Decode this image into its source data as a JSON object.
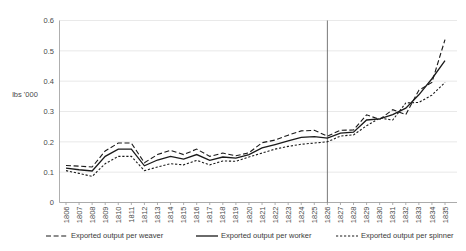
{
  "chart_data": {
    "type": "line",
    "title": "",
    "xlabel": "",
    "ylabel": "lbs '000",
    "ylim": [
      0,
      0.6
    ],
    "ytick_step": 0.1,
    "yticks": [
      "0",
      "0.1",
      "0.2",
      "0.3",
      "0.4",
      "0.5",
      "0.6"
    ],
    "grid": true,
    "legend_position": "bottom",
    "categories": [
      "1806",
      "1807",
      "1808",
      "1809",
      "1810",
      "1811",
      "1812",
      "1813",
      "1814",
      "1815",
      "1816",
      "1817",
      "1818",
      "1819",
      "1820",
      "1821",
      "1822",
      "1823",
      "1824",
      "1825",
      "1826",
      "1827",
      "1828",
      "1829",
      "1830",
      "1831",
      "1832",
      "1833",
      "1834",
      "1835"
    ],
    "annotations": [
      {
        "type": "vertical-line",
        "x": "1826",
        "label": ""
      }
    ],
    "series": [
      {
        "name": "Exported output per weaver",
        "style": "dashed",
        "values": [
          0.122,
          0.12,
          0.117,
          0.17,
          0.196,
          0.196,
          0.131,
          0.158,
          0.172,
          0.158,
          0.176,
          0.152,
          0.163,
          0.154,
          0.164,
          0.197,
          0.206,
          0.222,
          0.236,
          0.238,
          0.219,
          0.238,
          0.239,
          0.289,
          0.274,
          0.306,
          0.29,
          0.37,
          0.396,
          0.537
        ]
      },
      {
        "name": "Exported output per worker",
        "style": "solid",
        "values": [
          0.113,
          0.108,
          0.104,
          0.152,
          0.176,
          0.176,
          0.121,
          0.14,
          0.152,
          0.143,
          0.158,
          0.139,
          0.15,
          0.146,
          0.158,
          0.18,
          0.191,
          0.203,
          0.215,
          0.217,
          0.212,
          0.229,
          0.232,
          0.272,
          0.276,
          0.29,
          0.311,
          0.355,
          0.408,
          0.468
        ]
      },
      {
        "name": "Exported output per spinner",
        "style": "dotted",
        "values": [
          0.105,
          0.096,
          0.086,
          0.128,
          0.152,
          0.152,
          0.105,
          0.117,
          0.128,
          0.124,
          0.139,
          0.124,
          0.137,
          0.136,
          0.15,
          0.163,
          0.176,
          0.185,
          0.192,
          0.196,
          0.2,
          0.219,
          0.223,
          0.253,
          0.278,
          0.272,
          0.328,
          0.33,
          0.354,
          0.396
        ]
      }
    ]
  },
  "legend": {
    "items": [
      {
        "label": "Exported output per weaver",
        "style": "dashed"
      },
      {
        "label": "Exported output per worker",
        "style": "solid"
      },
      {
        "label": "Exported output per spinner",
        "style": "dotted"
      }
    ]
  }
}
